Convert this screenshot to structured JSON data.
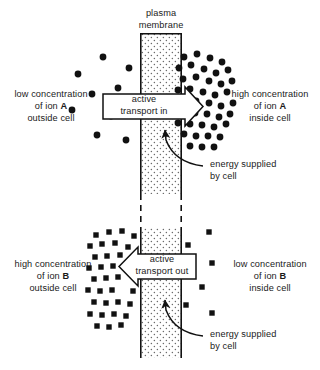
{
  "figure": {
    "title_label": "plasma\nmembrane",
    "plasma_membrane_line1": "plasma",
    "plasma_membrane_line2": "membrane"
  },
  "panels": {
    "top": {
      "left_label": {
        "line1": "low concentration",
        "line2_prefix": "of ion ",
        "line2_ion": "A",
        "line3": "outside cell"
      },
      "right_label": {
        "line1": "high concentration",
        "line2_prefix": "of ion ",
        "line2_ion": "A",
        "line3": "inside cell"
      },
      "transport_label": {
        "line1": "active",
        "line2": "transport in"
      },
      "energy_label": {
        "line1": "energy supplied",
        "line2": "by cell"
      },
      "ion_symbol": "circle",
      "ion_name": "A",
      "arrow_direction": "right",
      "outside_particles": [
        {
          "x": 72,
          "y": 110
        },
        {
          "x": 78,
          "y": 74
        },
        {
          "x": 92,
          "y": 94
        },
        {
          "x": 97,
          "y": 135
        },
        {
          "x": 103,
          "y": 57
        },
        {
          "x": 111,
          "y": 116
        },
        {
          "x": 118,
          "y": 88
        },
        {
          "x": 126,
          "y": 140
        },
        {
          "x": 129,
          "y": 68
        },
        {
          "x": 131,
          "y": 104
        }
      ],
      "inside_particles": [
        {
          "x": 184,
          "y": 57
        },
        {
          "x": 197,
          "y": 54
        },
        {
          "x": 210,
          "y": 58
        },
        {
          "x": 222,
          "y": 62
        },
        {
          "x": 179,
          "y": 68
        },
        {
          "x": 191,
          "y": 65
        },
        {
          "x": 204,
          "y": 69
        },
        {
          "x": 216,
          "y": 73
        },
        {
          "x": 228,
          "y": 70
        },
        {
          "x": 183,
          "y": 79
        },
        {
          "x": 196,
          "y": 77
        },
        {
          "x": 209,
          "y": 81
        },
        {
          "x": 221,
          "y": 84
        },
        {
          "x": 232,
          "y": 81
        },
        {
          "x": 178,
          "y": 90
        },
        {
          "x": 190,
          "y": 89
        },
        {
          "x": 203,
          "y": 92
        },
        {
          "x": 215,
          "y": 95
        },
        {
          "x": 227,
          "y": 92
        },
        {
          "x": 196,
          "y": 101
        },
        {
          "x": 209,
          "y": 103
        },
        {
          "x": 221,
          "y": 106
        },
        {
          "x": 233,
          "y": 103
        },
        {
          "x": 182,
          "y": 112
        },
        {
          "x": 195,
          "y": 113
        },
        {
          "x": 207,
          "y": 114
        },
        {
          "x": 219,
          "y": 117
        },
        {
          "x": 230,
          "y": 114
        },
        {
          "x": 178,
          "y": 123
        },
        {
          "x": 190,
          "y": 124
        },
        {
          "x": 202,
          "y": 125
        },
        {
          "x": 214,
          "y": 127
        },
        {
          "x": 226,
          "y": 124
        },
        {
          "x": 184,
          "y": 134
        },
        {
          "x": 196,
          "y": 136
        },
        {
          "x": 208,
          "y": 136
        },
        {
          "x": 220,
          "y": 137
        },
        {
          "x": 190,
          "y": 146
        },
        {
          "x": 202,
          "y": 147
        },
        {
          "x": 214,
          "y": 147
        }
      ]
    },
    "bottom": {
      "left_label": {
        "line1": "high concentration",
        "line2_prefix": "of ion ",
        "line2_ion": "B",
        "line3": "outside cell"
      },
      "right_label": {
        "line1": "low concentration",
        "line2_prefix": "of ion ",
        "line2_ion": "B",
        "line3": "inside cell"
      },
      "transport_label": {
        "line1": "active",
        "line2": "transport  out"
      },
      "energy_label": {
        "line1": "energy supplied",
        "line2": "by cell"
      },
      "ion_symbol": "square",
      "ion_name": "B",
      "arrow_direction": "left",
      "outside_particles": [
        {
          "x": 96,
          "y": 235
        },
        {
          "x": 109,
          "y": 232
        },
        {
          "x": 122,
          "y": 231
        },
        {
          "x": 134,
          "y": 236
        },
        {
          "x": 90,
          "y": 246
        },
        {
          "x": 102,
          "y": 244
        },
        {
          "x": 115,
          "y": 243
        },
        {
          "x": 128,
          "y": 247
        },
        {
          "x": 95,
          "y": 257
        },
        {
          "x": 107,
          "y": 256
        },
        {
          "x": 120,
          "y": 255
        },
        {
          "x": 132,
          "y": 258
        },
        {
          "x": 89,
          "y": 268
        },
        {
          "x": 101,
          "y": 267
        },
        {
          "x": 113,
          "y": 266
        },
        {
          "x": 94,
          "y": 279
        },
        {
          "x": 106,
          "y": 278
        },
        {
          "x": 118,
          "y": 277
        },
        {
          "x": 88,
          "y": 290
        },
        {
          "x": 100,
          "y": 291
        },
        {
          "x": 112,
          "y": 290
        },
        {
          "x": 133,
          "y": 291
        },
        {
          "x": 94,
          "y": 302
        },
        {
          "x": 106,
          "y": 303
        },
        {
          "x": 118,
          "y": 302
        },
        {
          "x": 130,
          "y": 304
        },
        {
          "x": 90,
          "y": 314
        },
        {
          "x": 102,
          "y": 315
        },
        {
          "x": 114,
          "y": 314
        },
        {
          "x": 126,
          "y": 316
        },
        {
          "x": 97,
          "y": 326
        },
        {
          "x": 109,
          "y": 327
        },
        {
          "x": 121,
          "y": 325
        }
      ],
      "inside_particles": [
        {
          "x": 209,
          "y": 232
        },
        {
          "x": 188,
          "y": 245
        },
        {
          "x": 212,
          "y": 263
        },
        {
          "x": 202,
          "y": 287
        },
        {
          "x": 186,
          "y": 305
        },
        {
          "x": 212,
          "y": 313
        }
      ]
    }
  },
  "membrane": {
    "x_left": 140,
    "x_right": 182,
    "top_segment": {
      "y_top": 33,
      "y_bottom": 194
    },
    "dashed_segment": {
      "y_top": 194,
      "y_bottom": 228
    },
    "bottom_segment": {
      "y_top": 228,
      "y_bottom": 358
    }
  },
  "colors": {
    "ink": "#1a1a1a",
    "background": "#ffffff",
    "membrane_fill": "#ffffff",
    "membrane_stipple": "#555555",
    "particle": "#111111"
  }
}
